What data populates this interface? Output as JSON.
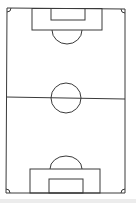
{
  "diagram": {
    "line_color": "#3a3a3a",
    "background": "#ffffff",
    "elements": [
      "touchlines",
      "goal-lines",
      "halfway-line",
      "center-circle",
      "penalty-areas",
      "goal-areas",
      "penalty-arcs",
      "corner-arcs"
    ]
  }
}
